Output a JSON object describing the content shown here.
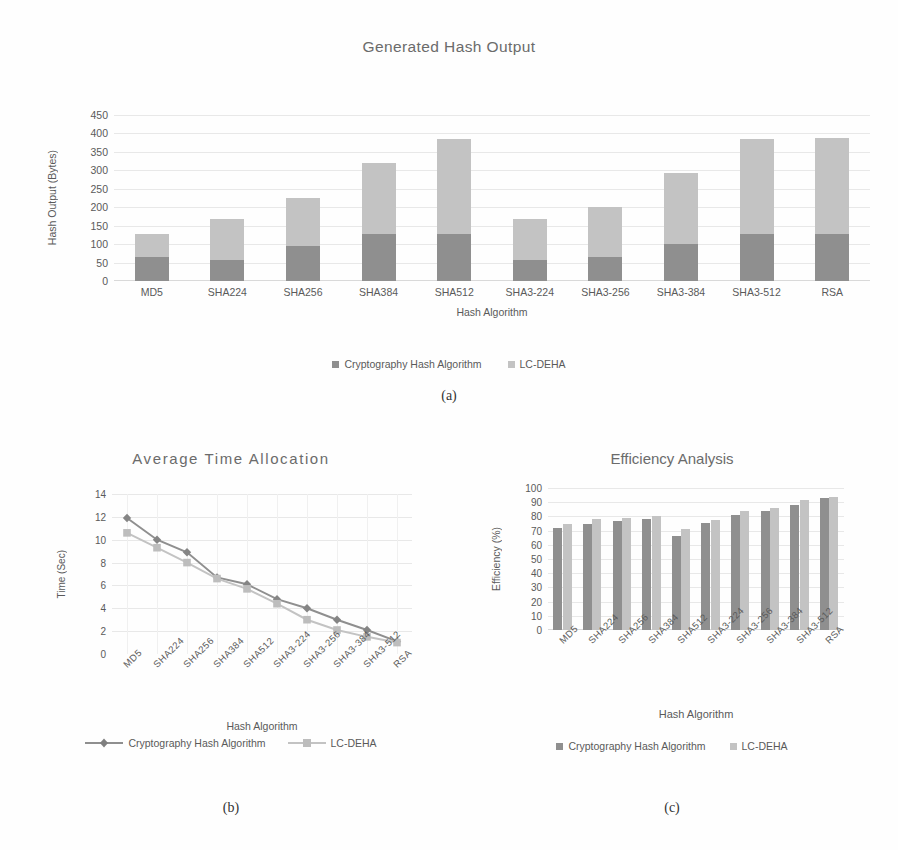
{
  "figure": {
    "captions": {
      "a": "(a)",
      "b": "(b)",
      "c": "(c)"
    }
  },
  "legend_labels": {
    "series1": "Cryptography Hash Algorithm",
    "series2": "LC-DEHA"
  },
  "colors": {
    "series1": "#8f8f8f",
    "series2": "#c3c3c3",
    "text": "#5a5a5a",
    "title": "#6b6b6b",
    "grid": "#e8e8e8",
    "background": "#fefefe"
  },
  "chart_data": [
    {
      "id": "a",
      "type": "bar",
      "stacked": true,
      "title": "Generated Hash Output",
      "xlabel": "Hash Algorithm",
      "ylabel": "Hash Output (Bytes)",
      "ylim": [
        0,
        450
      ],
      "yticks": [
        0,
        50,
        100,
        150,
        200,
        250,
        300,
        350,
        400,
        450
      ],
      "grid": true,
      "legend_position": "bottom",
      "categories": [
        "MD5",
        "SHA224",
        "SHA256",
        "SHA384",
        "SHA512",
        "SHA3-224",
        "SHA3-256",
        "SHA3-384",
        "SHA3-512",
        "RSA"
      ],
      "series": [
        {
          "name": "Cryptography Hash Algorithm",
          "values": [
            64,
            56,
            96,
            128,
            128,
            56,
            64,
            100,
            128,
            128
          ]
        },
        {
          "name": "LC-DEHA",
          "values": [
            64,
            112,
            128,
            192,
            256,
            112,
            136,
            192,
            256,
            260
          ]
        }
      ],
      "totals": [
        128,
        168,
        224,
        320,
        384,
        168,
        200,
        292,
        384,
        388
      ]
    },
    {
      "id": "b",
      "type": "line",
      "title": "Average Time Allocation",
      "xlabel": "Hash Algorithm",
      "ylabel": "Time (Sec)",
      "ylim": [
        0,
        14
      ],
      "yticks": [
        0,
        2,
        4,
        6,
        8,
        10,
        12,
        14
      ],
      "grid": true,
      "legend_position": "bottom",
      "categories": [
        "MD5",
        "SHA224",
        "SHA256",
        "SHA384",
        "SHA512",
        "SHA3-224",
        "SHA3-256",
        "SHA3-384",
        "SHA3-512",
        "RSA"
      ],
      "series": [
        {
          "name": "Cryptography Hash Algorithm",
          "values": [
            11.9,
            10.0,
            8.9,
            6.7,
            6.1,
            4.8,
            4.0,
            3.0,
            2.1,
            1.1
          ]
        },
        {
          "name": "LC-DEHA",
          "values": [
            10.6,
            9.3,
            8.0,
            6.6,
            5.7,
            4.4,
            3.0,
            2.1,
            1.5,
            1.0
          ]
        }
      ]
    },
    {
      "id": "c",
      "type": "bar",
      "stacked": false,
      "title": "Efficiency Analysis",
      "xlabel": "Hash Algorithm",
      "ylabel": "Efficiency (%)",
      "ylim": [
        0,
        100
      ],
      "yticks": [
        0,
        10,
        20,
        30,
        40,
        50,
        60,
        70,
        80,
        90,
        100
      ],
      "grid": true,
      "legend_position": "bottom",
      "categories": [
        "MD5",
        "SHA224",
        "SHA256",
        "SHA384",
        "SHA512",
        "SHA3-224",
        "SHA3-256",
        "SHA3-384",
        "SHA3-512",
        "RSA"
      ],
      "series": [
        {
          "name": "Cryptography Hash Algorithm",
          "values": [
            72,
            75,
            77,
            78.5,
            66.5,
            75.5,
            81,
            83.5,
            88,
            93
          ]
        },
        {
          "name": "LC-DEHA",
          "values": [
            75,
            78,
            79,
            80.5,
            71,
            77.5,
            84,
            86,
            91.5,
            93.5
          ]
        }
      ]
    }
  ]
}
